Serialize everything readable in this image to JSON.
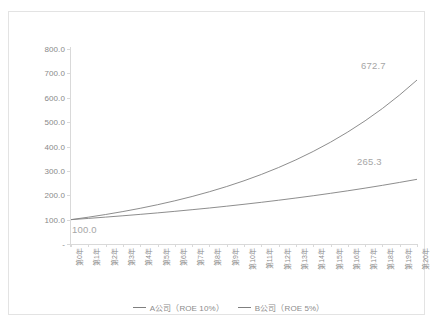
{
  "chart_data": {
    "type": "line",
    "title": "",
    "xlabel": "",
    "ylabel": "",
    "ylim": [
      0,
      800
    ],
    "y_ticks": [
      "-",
      "100.0",
      "200.0",
      "300.0",
      "400.0",
      "500.0",
      "600.0",
      "700.0",
      "800.0"
    ],
    "y_tick_values": [
      0,
      100,
      200,
      300,
      400,
      500,
      600,
      700,
      800
    ],
    "grid": false,
    "legend_position": "bottom-center",
    "categories": [
      "第0年",
      "第1年",
      "第2年",
      "第3年",
      "第4年",
      "第5年",
      "第6年",
      "第7年",
      "第8年",
      "第9年",
      "第10年",
      "第11年",
      "第12年",
      "第13年",
      "第14年",
      "第15年",
      "第16年",
      "第17年",
      "第18年",
      "第19年",
      "第20年"
    ],
    "series": [
      {
        "name": "A公司（ROE 10%）",
        "color": "#808080",
        "values": [
          100.0,
          110.0,
          121.0,
          133.1,
          146.4,
          161.1,
          177.2,
          194.9,
          214.4,
          235.8,
          259.4,
          285.3,
          313.8,
          345.2,
          379.7,
          417.7,
          459.5,
          505.4,
          555.9,
          611.6,
          672.7
        ]
      },
      {
        "name": "B公司（ROE 5%）",
        "color": "#808080",
        "values": [
          100.0,
          105.0,
          110.3,
          115.8,
          121.6,
          127.6,
          134.0,
          140.7,
          147.7,
          155.1,
          162.9,
          171.0,
          179.6,
          188.6,
          198.0,
          207.9,
          218.3,
          229.2,
          240.7,
          252.7,
          265.3
        ]
      }
    ],
    "annotations": [
      {
        "id": "start",
        "text": "100.0"
      },
      {
        "id": "seriesA",
        "text": "672.7"
      },
      {
        "id": "seriesB",
        "text": "265.3"
      }
    ],
    "legend": [
      {
        "label": "A公司（ROE 10%）",
        "color": "#7f7f7f"
      },
      {
        "label": "B公司（ROE 5%）",
        "color": "#7f7f7f"
      }
    ]
  }
}
